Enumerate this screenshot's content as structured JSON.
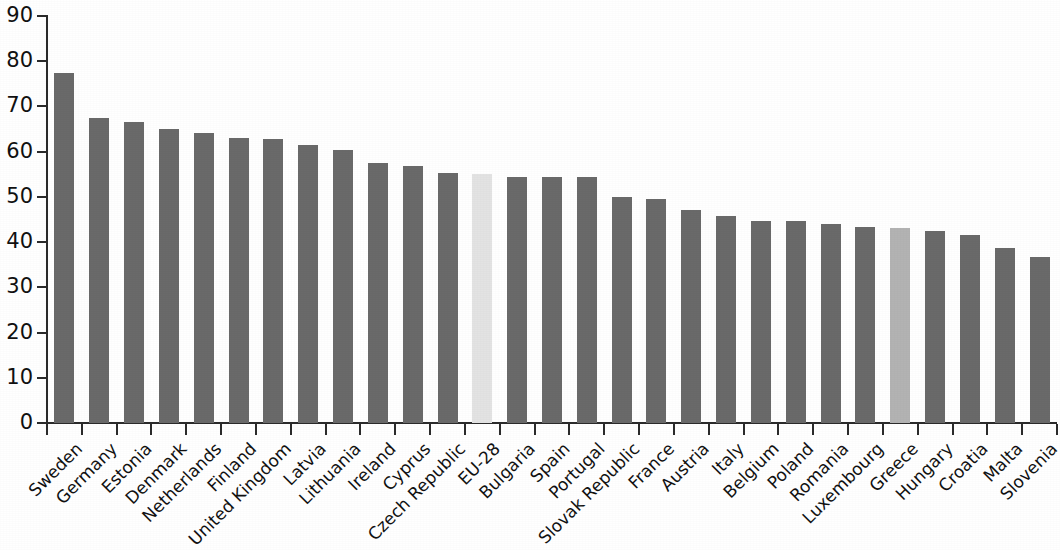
{
  "chart_data": {
    "type": "bar",
    "title": "",
    "subtitle": "",
    "xlabel": "",
    "ylabel": "",
    "ylim": [
      0,
      90
    ],
    "yticks": [
      0,
      10,
      20,
      30,
      40,
      50,
      60,
      70,
      80,
      90
    ],
    "ytick_labels": [
      "0",
      "10",
      "20",
      "30",
      "40",
      "50",
      "60",
      "70",
      "80",
      "90"
    ],
    "grid": false,
    "legend": null,
    "orientation": "vertical",
    "categories": [
      "Sweden",
      "Germany",
      "Estonia",
      "Denmark",
      "Netherlands",
      "Finland",
      "United Kingdom",
      "Latvia",
      "Lithuania",
      "Ireland",
      "Cyprus",
      "Czech Republic",
      "EU-28",
      "Bulgaria",
      "Spain",
      "Portugal",
      "Slovak Republic",
      "France",
      "Austria",
      "Italy",
      "Belgium",
      "Poland",
      "Romania",
      "Luxembourg",
      "Greece",
      "Hungary",
      "Croatia",
      "Malta",
      "Slovenia"
    ],
    "values": [
      77.5,
      67.5,
      66.5,
      65.0,
      64.2,
      63.0,
      62.8,
      61.5,
      60.3,
      57.5,
      56.8,
      55.2,
      55.0,
      54.5,
      54.5,
      54.5,
      50.0,
      49.6,
      47.0,
      45.8,
      44.7,
      44.6,
      44.0,
      43.3,
      43.2,
      42.4,
      41.5,
      38.8,
      36.8
    ],
    "bar_styles": [
      "default",
      "default",
      "default",
      "default",
      "default",
      "default",
      "default",
      "default",
      "default",
      "default",
      "default",
      "default",
      "highlight-light",
      "default",
      "default",
      "default",
      "default",
      "default",
      "default",
      "default",
      "default",
      "default",
      "default",
      "default",
      "highlight-mid",
      "default",
      "default",
      "default",
      "default"
    ]
  },
  "colors": {
    "bar_default": "#6a6a6a",
    "bar_highlight_light": "#e3e3e3",
    "bar_highlight_mid": "#b3b3b3",
    "axis": "#2b2b2b",
    "text": "#111111",
    "background": "#ffffff"
  }
}
